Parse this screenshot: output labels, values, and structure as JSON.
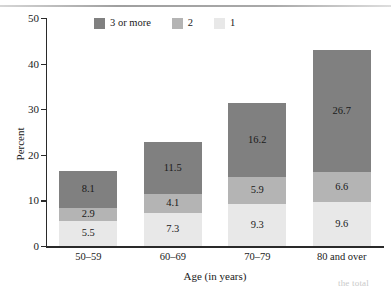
{
  "chart_data": {
    "type": "bar",
    "subtype": "stacked-bar",
    "title": "",
    "xlabel": "Age (in years)",
    "ylabel": "Percent",
    "categories": [
      "50–59",
      "60–69",
      "70–79",
      "80 and over"
    ],
    "series": [
      {
        "name": "1",
        "color": "#e8e8e8",
        "values": [
          5.5,
          7.3,
          9.3,
          9.6
        ]
      },
      {
        "name": "2",
        "color": "#b4b4b4",
        "values": [
          2.9,
          4.1,
          5.9,
          6.6
        ]
      },
      {
        "name": "3 or more",
        "color": "#808080",
        "values": [
          8.1,
          11.5,
          16.2,
          26.7
        ]
      }
    ],
    "totals": [
      16.5,
      22.9,
      31.4,
      42.9
    ],
    "ylim": [
      0,
      50
    ],
    "yticks": [
      0,
      10,
      20,
      30,
      40,
      50
    ],
    "ytick_labels": [
      "0",
      "10",
      "20",
      "30",
      "40",
      "50"
    ],
    "grid": false,
    "legend_position": "top-left-inside",
    "legend_order": [
      "3 or more",
      "2",
      "1"
    ]
  },
  "axis": {
    "y_title": "Percent",
    "x_title": "Age (in years)"
  },
  "legend": {
    "items": [
      {
        "label": "3 or more",
        "color": "#808080"
      },
      {
        "label": "2",
        "color": "#b4b4b4"
      },
      {
        "label": "1",
        "color": "#e8e8e8"
      }
    ]
  },
  "page_artifact": {
    "bottom_text": "the total"
  }
}
